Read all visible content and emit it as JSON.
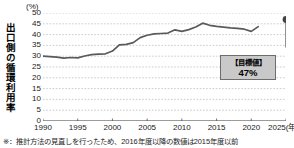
{
  "chart_data": {
    "type": "line",
    "title": "",
    "subtitle": "",
    "xlabel": "",
    "ylabel": "出口側の循環利用率",
    "unit_label": "(%)",
    "xlim": [
      1990,
      2025
    ],
    "ylim": [
      0,
      50
    ],
    "y_ticks": [
      50,
      45,
      40,
      35,
      30,
      25,
      20,
      15,
      10,
      5,
      0
    ],
    "x_ticks": [
      "1990",
      "1995",
      "2000",
      "2005",
      "2010",
      "2015",
      "2020",
      "2025(年度)"
    ],
    "x_tick_values": [
      1990,
      1995,
      2000,
      2005,
      2010,
      2015,
      2020,
      2025
    ],
    "grid": "horizontal-dashed",
    "legend": "none",
    "line_color": "#5a5a5a",
    "marker_color": "#444444",
    "series": [
      {
        "name": "出口側の循環利用率",
        "x": [
          1990,
          1991,
          1992,
          1993,
          1994,
          1995,
          1996,
          1997,
          1998,
          1999,
          2000,
          2001,
          2002,
          2003,
          2004,
          2005,
          2006,
          2007,
          2008,
          2009,
          2010,
          2011,
          2012,
          2013,
          2014,
          2015,
          2016,
          2017,
          2018,
          2019,
          2020,
          2021
        ],
        "values": [
          30.0,
          29.8,
          29.6,
          29.1,
          29.4,
          29.2,
          30.1,
          30.7,
          31.0,
          31.1,
          32.4,
          35.2,
          35.5,
          36.3,
          38.6,
          39.7,
          40.3,
          40.5,
          40.7,
          42.2,
          41.5,
          42.3,
          43.5,
          45.3,
          44.3,
          43.8,
          43.5,
          43.1,
          42.9,
          42.5,
          41.5,
          43.7
        ]
      }
    ],
    "target_point": {
      "x": 2025,
      "value": 47,
      "label_title": "【目標値】",
      "label_value": "47%"
    }
  },
  "annotations": {
    "footnote": "※：推計方法の見直しを行ったため、2016年度以降の数値は2015年度以前"
  }
}
